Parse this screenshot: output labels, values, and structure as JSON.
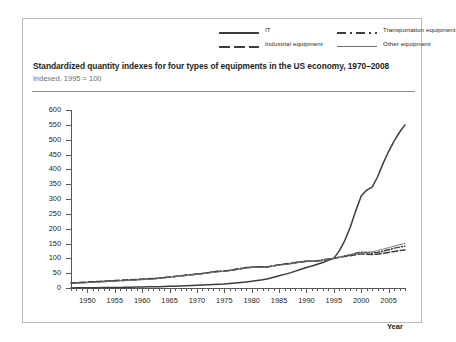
{
  "legend": {
    "items": [
      {
        "label": "IT",
        "style": "solid-dark",
        "color": "#3d3d3d"
      },
      {
        "label": "Transportation equipment",
        "style": "dash-dot",
        "color": "#3d3d3d"
      },
      {
        "label": "Industrial equipment",
        "style": "long-dash",
        "color": "#3d3d3d"
      },
      {
        "label": "Other equipment",
        "style": "thin-solid",
        "color": "#6d6e71"
      }
    ]
  },
  "title": "Standardized quantity indexes for four types of equipments in the US economy, 1970–2008",
  "subtitle": "Indexed, 1995 = 100",
  "xaxis_title": "Year",
  "chart_data": {
    "type": "line",
    "title": "Standardized quantity indexes for four types of equipments in the US economy, 1970–2008",
    "subtitle": "Indexed, 1995 = 100",
    "xlabel": "Year",
    "ylabel": "",
    "xlim": [
      1947,
      2008
    ],
    "ylim": [
      0,
      600
    ],
    "yticks": [
      0,
      50,
      100,
      150,
      200,
      250,
      300,
      350,
      400,
      450,
      500,
      550,
      600
    ],
    "xticks": [
      1950,
      1955,
      1960,
      1965,
      1970,
      1975,
      1980,
      1985,
      1990,
      1995,
      2000,
      2005
    ],
    "xtick_minor_step": 1,
    "grid": false,
    "legend_position": "top-right",
    "x": [
      1947,
      1948,
      1949,
      1950,
      1951,
      1952,
      1953,
      1954,
      1955,
      1956,
      1957,
      1958,
      1959,
      1960,
      1961,
      1962,
      1963,
      1964,
      1965,
      1966,
      1967,
      1968,
      1969,
      1970,
      1971,
      1972,
      1973,
      1974,
      1975,
      1976,
      1977,
      1978,
      1979,
      1980,
      1981,
      1982,
      1983,
      1984,
      1985,
      1986,
      1987,
      1988,
      1989,
      1990,
      1991,
      1992,
      1993,
      1994,
      1995,
      1996,
      1997,
      1998,
      1999,
      2000,
      2001,
      2002,
      2003,
      2004,
      2005,
      2006,
      2007,
      2008
    ],
    "series": [
      {
        "name": "IT",
        "style": "solid-dark",
        "color": "#3d3d3d",
        "values": [
          0.4,
          0.5,
          0.6,
          0.7,
          0.9,
          1.1,
          1.3,
          1.5,
          1.8,
          2.1,
          2.4,
          2.7,
          3.0,
          3.4,
          3.8,
          4.2,
          4.6,
          5.1,
          5.6,
          6.2,
          6.8,
          7.5,
          8.2,
          9.0,
          9.8,
          10.8,
          11.8,
          12.8,
          13.8,
          15.2,
          16.8,
          18.5,
          20.5,
          22.5,
          25.0,
          27.5,
          31.0,
          36.0,
          41.0,
          46.0,
          51.0,
          57.0,
          63.0,
          69.0,
          74.0,
          80.0,
          86.0,
          93.0,
          100.0,
          125.0,
          160.0,
          205.0,
          260.0,
          310.0,
          330.0,
          340.0,
          375.0,
          420.0,
          460.0,
          495.0,
          525.0,
          550.0
        ]
      },
      {
        "name": "Industrial equipment",
        "style": "long-dash",
        "color": "#3d3d3d",
        "values": [
          17,
          18,
          19,
          20,
          21,
          22,
          23,
          24,
          25,
          26,
          27,
          28,
          29,
          30,
          31,
          32,
          33,
          35,
          37,
          39,
          41,
          43,
          45,
          47,
          49,
          51,
          54,
          56,
          57,
          59,
          62,
          65,
          68,
          70,
          72,
          72,
          72,
          75,
          78,
          80,
          82,
          85,
          88,
          90,
          90,
          91,
          93,
          96,
          100,
          103,
          106,
          109,
          112,
          115,
          114,
          113,
          114,
          117,
          120,
          123,
          126,
          128
        ]
      },
      {
        "name": "Transportation equipment",
        "style": "dash-dot",
        "color": "#3d3d3d",
        "values": [
          16,
          17,
          18,
          19,
          20,
          21,
          22,
          23,
          24,
          25,
          26,
          27,
          28,
          29,
          30,
          31,
          33,
          35,
          37,
          39,
          41,
          43,
          45,
          47,
          49,
          52,
          55,
          57,
          57,
          60,
          63,
          66,
          69,
          70,
          71,
          70,
          71,
          75,
          78,
          81,
          83,
          86,
          89,
          91,
          90,
          92,
          95,
          98,
          100,
          104,
          108,
          112,
          117,
          121,
          119,
          118,
          120,
          124,
          129,
          134,
          138,
          141
        ]
      },
      {
        "name": "Other equipment",
        "style": "thin-solid",
        "color": "#6d6e71",
        "values": [
          15,
          16,
          17,
          18,
          19,
          20,
          21,
          22,
          23,
          24,
          25,
          26,
          27,
          28,
          29,
          30,
          32,
          34,
          36,
          38,
          40,
          42,
          44,
          46,
          48,
          50,
          53,
          55,
          56,
          58,
          61,
          64,
          67,
          69,
          70,
          70,
          71,
          74,
          77,
          79,
          81,
          84,
          87,
          89,
          89,
          91,
          94,
          97,
          100,
          104,
          108,
          112,
          116,
          120,
          121,
          122,
          126,
          131,
          136,
          141,
          146,
          150
        ]
      }
    ]
  }
}
